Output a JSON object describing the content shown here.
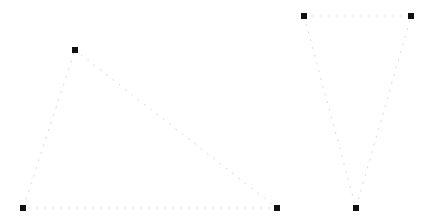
{
  "canvas": {
    "width": 432,
    "height": 223,
    "background_color": "#ffffff",
    "title": "Dotted Triangles"
  },
  "style": {
    "edge_color": "#d9d9d9",
    "edge_width": 1,
    "edge_dash_pattern": "1 7",
    "edge_linecap": "square",
    "vertex_color": "#111111",
    "vertex_size": 6,
    "vertex_shape": "square"
  },
  "chart_data": {
    "type": "scatter",
    "title": "",
    "xlabel": "",
    "ylabel": "",
    "xlim": [
      0,
      432
    ],
    "ylim": [
      0,
      223
    ],
    "grid": false,
    "legend_position": "none",
    "annotations": [],
    "shapes": [
      {
        "name": "left-triangle",
        "label": "Triangle A",
        "closed": true,
        "vertices": [
          {
            "name": "apex",
            "x": 75,
            "y": 50
          },
          {
            "name": "bottom-right",
            "x": 277,
            "y": 208
          },
          {
            "name": "bottom-left",
            "x": 23,
            "y": 208
          }
        ]
      },
      {
        "name": "right-triangle",
        "label": "Triangle B",
        "closed": true,
        "vertices": [
          {
            "name": "top-left",
            "x": 304,
            "y": 16
          },
          {
            "name": "top-right",
            "x": 411,
            "y": 16
          },
          {
            "name": "bottom-apex",
            "x": 356,
            "y": 208
          }
        ]
      }
    ]
  }
}
